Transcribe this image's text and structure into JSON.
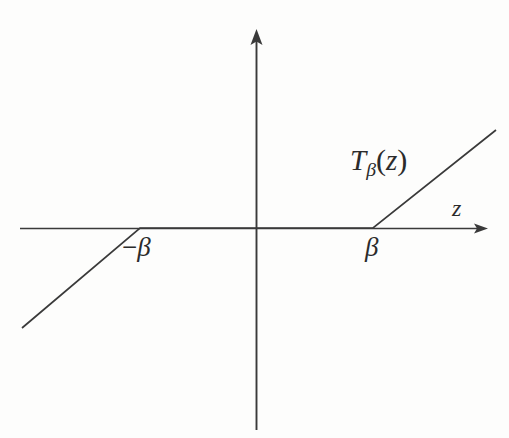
{
  "figure": {
    "background_color": "#fdfdfc",
    "ink_color": "#3a3a3a",
    "labels": {
      "function_name": "T",
      "function_subscript": "β",
      "function_argument_open": "(",
      "function_variable": "z",
      "function_argument_close": ")",
      "function_full": "T_β(z)",
      "axis_x": "z",
      "threshold_negative_sign": "−",
      "threshold_negative": "β",
      "threshold_positive": "β"
    }
  },
  "chart_data": {
    "type": "line",
    "xlabel": "z",
    "ylabel": "",
    "grid": false,
    "legend": null,
    "annotations": [
      {
        "text": "T_β(z)",
        "x_px": 352,
        "y_px": 150,
        "role": "curve-label"
      },
      {
        "text": "z",
        "x_px": 455,
        "y_px": 202,
        "role": "x-axis-label"
      },
      {
        "text": "−β",
        "x_px": 125,
        "y_px": 240,
        "role": "x-tick-label"
      },
      {
        "text": "β",
        "x_px": 368,
        "y_px": 240,
        "role": "x-tick-label"
      }
    ],
    "axes": {
      "origin_px": [
        256,
        228
      ],
      "x_axis_px": {
        "x1": 20,
        "y1": 228,
        "x2": 488,
        "y2": 228,
        "arrow": "end"
      },
      "y_axis_px": {
        "x1": 256,
        "y1": 430,
        "x2": 256,
        "y2": 30,
        "arrow": "end"
      },
      "x_tick_values": [
        "-β",
        "0",
        "β"
      ],
      "xlim": [
        "-∞",
        "+∞"
      ],
      "ylim": [
        "-∞",
        "+∞"
      ]
    },
    "series": [
      {
        "name": "T_β(z)",
        "description": "Soft-thresholding: T_β(z) = z + β for z < -β; 0 for |z| ≤ β; z - β for z > β",
        "points_px": [
          [
            22,
            328
          ],
          [
            140,
            228
          ],
          [
            373,
            228
          ],
          [
            496,
            130
          ]
        ],
        "breakpoints": [
          "-β",
          "β"
        ],
        "slope_left": 0.85,
        "slope_flat": 0,
        "slope_right": 0.8
      }
    ]
  }
}
